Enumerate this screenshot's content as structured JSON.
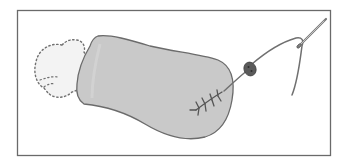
{
  "illustration": {
    "subject": "sewing-step-illustration",
    "description": "Stuffed fabric tube with filling poking out of the open end, a stitched seam, a button threaded on the line, and a needle with thread",
    "colors": {
      "background": "#ffffff",
      "frame": "#6a6a6a",
      "tube_fill": "#c9c9c9",
      "tube_outline": "#6b6b6b",
      "stuffing_dots": "#707070",
      "stuffing_fill": "#f3f3f3",
      "thread": "#707070",
      "button": "#5a5a5a",
      "needle": "#888888"
    },
    "frame": {
      "x": 17,
      "y": 10,
      "width": 313,
      "height": 145
    },
    "elements": [
      {
        "name": "stuffing",
        "label": "stuffing"
      },
      {
        "name": "fabric-tube",
        "label": "fabric tube"
      },
      {
        "name": "seam-stitches",
        "label": "stitches"
      },
      {
        "name": "button",
        "label": "button"
      },
      {
        "name": "thread",
        "label": "thread"
      },
      {
        "name": "needle",
        "label": "needle"
      }
    ]
  }
}
